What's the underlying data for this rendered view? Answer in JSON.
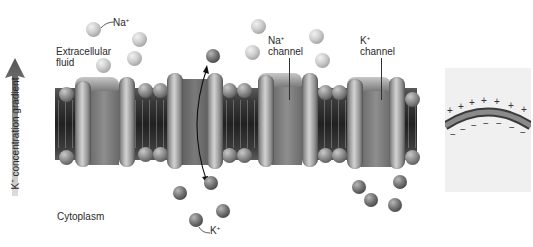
{
  "diagram": {
    "type": "cell membrane ion channels",
    "labels": {
      "na_ion": {
        "base": "Na",
        "sup": "+"
      },
      "k_ion": {
        "base": "K",
        "sup": "+"
      },
      "extracellular": [
        "Extracellular",
        "fluid"
      ],
      "cytoplasm": "Cytoplasm",
      "na_channel": {
        "base": "Na",
        "sup": "+",
        "line2": "channel"
      },
      "k_channel": {
        "base": "K",
        "sup": "+",
        "line2": "channel"
      },
      "gradient": {
        "base": "K",
        "sup": "+",
        "rest": " concentration gradient"
      }
    },
    "inset": {
      "outer_charges": [
        "+",
        "+",
        "+",
        "+",
        "+",
        "+",
        "+"
      ],
      "inner_charges": [
        "−",
        "−",
        "−",
        "−",
        "−",
        "−",
        "−"
      ]
    },
    "colors": {
      "membrane": "#2a2a2a",
      "protein": "#a8a8a8",
      "na_ion": "#c8c8c8",
      "k_ion": "#5a5a5a",
      "inset_bg": "#f0f0f0"
    }
  }
}
